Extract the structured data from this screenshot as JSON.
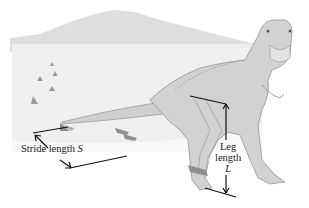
{
  "diagram": {
    "labels": {
      "stride": {
        "text": "Stride length",
        "symbol": "S"
      },
      "leg": {
        "line1": "Leg",
        "line2": "length",
        "symbol": "L"
      }
    },
    "colors": {
      "background": "#ffffff",
      "ground": "#eeeeee",
      "mountain": "#dcdcdc",
      "body": "#cfcfcf",
      "outline": "#8a8a8a",
      "footprint": "#8f8f8f",
      "arrow": "#111111"
    }
  }
}
